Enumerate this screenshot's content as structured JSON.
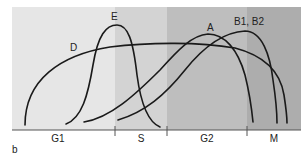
{
  "panel_label": "b",
  "phases": [
    {
      "label": "G1",
      "x0": 12,
      "x1": 115,
      "color": "#e6e6e6"
    },
    {
      "label": "S",
      "x0": 115,
      "x1": 167,
      "color": "#d2d2d2"
    },
    {
      "label": "G2",
      "x0": 167,
      "x1": 247,
      "color": "#bdbdbd"
    },
    {
      "label": "M",
      "x0": 247,
      "x1": 301,
      "color": "#adadad"
    }
  ],
  "curves": [
    {
      "label": "D",
      "label_pos": [
        70,
        51
      ]
    },
    {
      "label": "E",
      "label_pos": [
        114,
        19
      ]
    },
    {
      "label": "A",
      "label_pos": [
        211,
        31
      ]
    },
    {
      "label": "B1, B2",
      "label_pos": [
        250,
        25
      ]
    }
  ],
  "colors": {
    "curve": "#1a1a1a",
    "axis": "#555555"
  }
}
